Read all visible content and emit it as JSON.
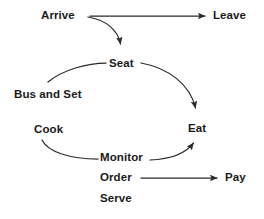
{
  "diagram": {
    "background_color": "#ffffff",
    "line_color": "#2b2b2b",
    "text_color": "#1a1a1a",
    "nodes": [
      {
        "id": "arrive",
        "label": "Arrive",
        "x": 41,
        "y": 9
      },
      {
        "id": "leave",
        "label": "Leave",
        "x": 213,
        "y": 9
      },
      {
        "id": "seat",
        "label": "Seat",
        "x": 109,
        "y": 57
      },
      {
        "id": "bus_and_set",
        "label": "Bus and Set",
        "x": 14,
        "y": 88
      },
      {
        "id": "cook",
        "label": "Cook",
        "x": 34,
        "y": 123
      },
      {
        "id": "eat",
        "label": "Eat",
        "x": 188,
        "y": 122
      },
      {
        "id": "monitor",
        "label": "Monitor",
        "x": 100,
        "y": 151
      },
      {
        "id": "order",
        "label": "Order",
        "x": 100,
        "y": 171
      },
      {
        "id": "pay",
        "label": "Pay",
        "x": 225,
        "y": 171
      },
      {
        "id": "serve",
        "label": "Serve",
        "x": 100,
        "y": 192
      }
    ],
    "edges": [
      {
        "id": "arrive-to-leave",
        "from": "arrive",
        "to": "leave",
        "style": "straight",
        "arrowhead": true,
        "path": "M 90 16 L 205 16"
      },
      {
        "id": "arrive-to-seat",
        "from": "arrive",
        "to": "seat",
        "style": "curved",
        "arrowhead": true,
        "path": "M 88 17 C 106 20 118 30 120.5 44"
      },
      {
        "id": "seat-to-bus-and-set",
        "from": "seat",
        "to": "bus_and_set",
        "style": "curved",
        "arrowhead": false,
        "path": "M 106 63 C 88 63 62 70 48 82"
      },
      {
        "id": "seat-to-eat",
        "from": "seat",
        "to": "eat",
        "style": "curved",
        "arrowhead": true,
        "path": "M 141 63 C 168 68 190 84 195.5 108"
      },
      {
        "id": "cook-to-monitor",
        "from": "cook",
        "to": "monitor",
        "style": "curved",
        "arrowhead": false,
        "path": "M 42 140 C 48 152 70 159 98 159"
      },
      {
        "id": "monitor-to-eat",
        "from": "monitor",
        "to": "eat",
        "style": "curved",
        "arrowhead": true,
        "path": "M 150 160 C 170 159 186 153 193.5 143"
      },
      {
        "id": "order-to-pay",
        "from": "order",
        "to": "pay",
        "style": "straight",
        "arrowhead": true,
        "path": "M 141 178 L 217 178"
      }
    ]
  }
}
